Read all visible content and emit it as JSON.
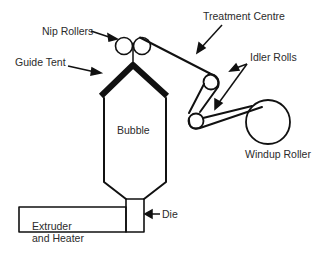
{
  "diagram": {
    "type": "process-diagram",
    "labels": {
      "nip_rollers": "Nip Rollers",
      "treatment_centre": "Treatment Centre",
      "guide_tent": "Guide Tent",
      "idler_rolls": "Idler Rolls",
      "bubble": "Bubble",
      "windup_roller": "Windup Roller",
      "die": "Die",
      "extruder_line1": "Extruder",
      "extruder_line2": "and Heater"
    },
    "colors": {
      "stroke": "#111111",
      "text": "#2b2b2b",
      "background": "#ffffff"
    }
  }
}
